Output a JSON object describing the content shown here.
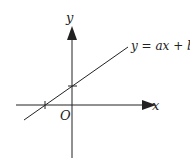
{
  "diagram": {
    "type": "coordinate-graph",
    "axes": {
      "x_label": "x",
      "y_label": "y",
      "origin_label": "O"
    },
    "line": {
      "equation": "y = ax + b",
      "description": "straight line with positive slope, negative x-intercept and positive y-intercept"
    },
    "colors": {
      "stroke": "#222222",
      "background": "#ffffff"
    }
  }
}
